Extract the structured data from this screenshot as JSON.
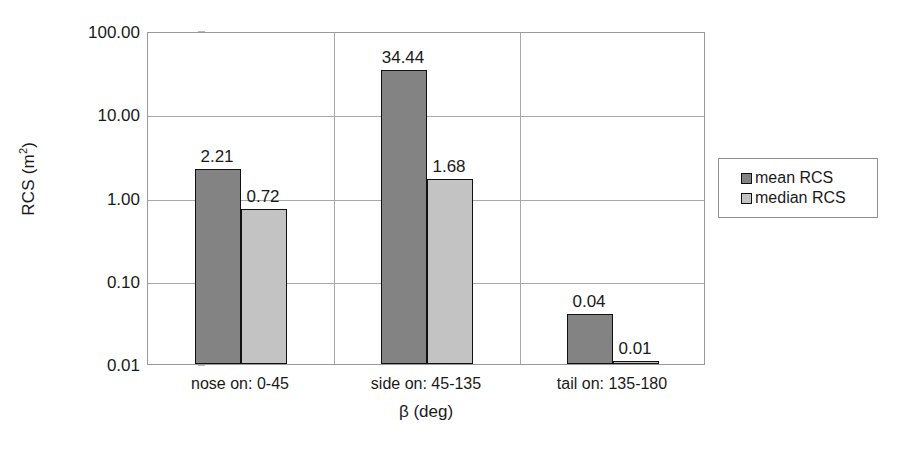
{
  "chart_data": {
    "type": "bar",
    "title": "",
    "xlabel": "β (deg)",
    "ylabel": "RCS (m²)",
    "yscale": "log",
    "ylim": [
      0.01,
      100.0
    ],
    "ytick_labels": [
      "100.00",
      "10.00",
      "1.00",
      "0.10",
      "0.01"
    ],
    "ytick_values": [
      100.0,
      10.0,
      1.0,
      0.1,
      0.01
    ],
    "grid": "horizontal-and-category-separators",
    "legend_position": "right",
    "categories": [
      "nose on:  0-45",
      "side on: 45-135",
      "tail on: 135-180"
    ],
    "series": [
      {
        "name": "mean RCS",
        "color": "#838383",
        "values": [
          2.21,
          34.44,
          0.04
        ],
        "labels": [
          "2.21",
          "34.44",
          "0.04"
        ]
      },
      {
        "name": "median RCS",
        "color": "#c3c3c3",
        "values": [
          0.72,
          1.68,
          0.01
        ],
        "labels": [
          "0.72",
          "1.68",
          "0.01"
        ]
      }
    ]
  },
  "axis": {
    "y_title_main": "RCS (m",
    "y_title_sup": "2",
    "y_title_close": ")",
    "x_title": "β (deg)"
  },
  "legend": {
    "items": [
      {
        "label": "mean RCS",
        "swatch": "mean"
      },
      {
        "label": "median RCS",
        "swatch": "median"
      }
    ]
  }
}
